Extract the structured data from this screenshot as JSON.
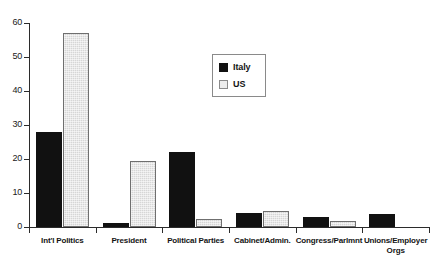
{
  "chart_data": {
    "type": "bar",
    "title": "",
    "xlabel": "",
    "ylabel": "",
    "ylim": [
      0,
      60
    ],
    "ytick_values": [
      0,
      10,
      20,
      30,
      40,
      50,
      60
    ],
    "ytick_labels": [
      "0",
      "10",
      "20",
      "30",
      "40",
      "50",
      "60"
    ],
    "grid": false,
    "legend_position": "upper-center",
    "categories": [
      "Int'l Politics",
      "President",
      "Political Parties",
      "Cabinet/Admin.",
      "Congress/Parlmnt",
      "Unions/Employer Orgs"
    ],
    "category_lines": [
      [
        "Int'l Politics",
        ""
      ],
      [
        "President",
        ""
      ],
      [
        "Political Parties",
        ""
      ],
      [
        "Cabinet/Admin.",
        ""
      ],
      [
        "Congress/Parlmnt",
        ""
      ],
      [
        "Unions/Employer",
        "Orgs"
      ]
    ],
    "series": [
      {
        "name": "Italy",
        "color": "#111111",
        "values": [
          28,
          1.2,
          22,
          4,
          2.8,
          3.8
        ]
      },
      {
        "name": "US",
        "color": "#d6d6d6",
        "values": [
          57,
          19.4,
          2.5,
          4.8,
          1.8,
          0
        ]
      }
    ]
  },
  "legend": {
    "items": [
      {
        "label": "Italy",
        "style": "italy"
      },
      {
        "label": "US",
        "style": "us"
      }
    ]
  }
}
